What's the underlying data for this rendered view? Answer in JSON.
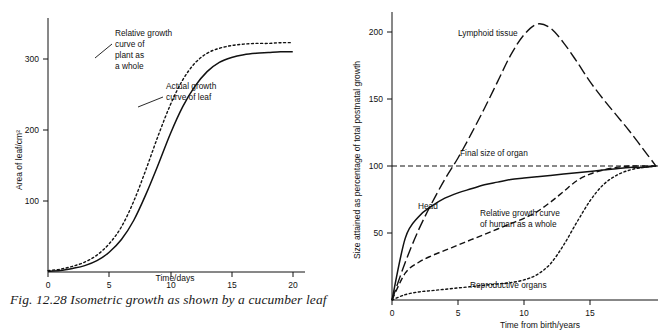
{
  "figure": {
    "caption": "Fig. 12.28 Isometric growth as shown by a cucumber leaf"
  },
  "chart_data": [
    {
      "type": "line",
      "title": "",
      "xlabel": "Time/days",
      "ylabel": "Area of leaf/cm²",
      "xlim": [
        0,
        21
      ],
      "ylim": [
        0,
        360
      ],
      "xticks": [
        "0",
        "5",
        "10",
        "15",
        "20"
      ],
      "yticks": [
        "100",
        "200",
        "300"
      ],
      "grid": false,
      "legend": "none",
      "annotations": [
        "Relative growth curve of plant as a whole",
        "Actual growth curve of leaf"
      ],
      "series": [
        {
          "name": "Relative growth curve of plant as a whole",
          "style": "dotted",
          "x": [
            0,
            1,
            2,
            3,
            4,
            5,
            6,
            7,
            8,
            9,
            10,
            11,
            12,
            13,
            14,
            15,
            16,
            17,
            18,
            19,
            20
          ],
          "y": [
            2,
            4,
            8,
            14,
            24,
            40,
            64,
            100,
            145,
            193,
            237,
            272,
            296,
            310,
            317,
            321,
            323,
            324,
            324,
            325,
            325
          ]
        },
        {
          "name": "Actual growth curve of leaf",
          "style": "solid",
          "x": [
            0,
            1,
            2,
            3,
            4,
            5,
            6,
            7,
            8,
            9,
            10,
            11,
            12,
            13,
            14,
            15,
            16,
            17,
            18,
            19,
            20
          ],
          "y": [
            1,
            2,
            5,
            9,
            16,
            28,
            46,
            73,
            110,
            152,
            196,
            234,
            263,
            284,
            297,
            304,
            308,
            310,
            311,
            312,
            312
          ]
        }
      ]
    },
    {
      "type": "line",
      "title": "",
      "xlabel": "Time from birth/years",
      "ylabel": "Size attained as percentage of total postnatal growth",
      "xlim": [
        0,
        20
      ],
      "ylim": [
        0,
        215
      ],
      "xticks": [
        "0",
        "5",
        "10",
        "15"
      ],
      "yticks": [
        "50",
        "100",
        "150",
        "200"
      ],
      "grid": false,
      "legend": "none",
      "annotations": [
        "Lymphoid tissue",
        "Final size of organ",
        "Head",
        "Relative growth curve of human as a whole",
        "Reproductive organs"
      ],
      "series": [
        {
          "name": "Lymphoid tissue",
          "style": "dash-dot-long",
          "x": [
            0,
            1,
            2,
            3,
            4,
            5,
            6,
            7,
            8,
            9,
            10,
            11,
            12,
            13,
            14,
            15,
            16,
            17,
            18,
            19,
            20
          ],
          "y": [
            0,
            28,
            52,
            72,
            90,
            106,
            124,
            143,
            163,
            183,
            198,
            206,
            203,
            192,
            178,
            163,
            150,
            138,
            126,
            113,
            100
          ]
        },
        {
          "name": "Head",
          "style": "solid",
          "x": [
            0,
            1,
            2,
            3,
            4,
            5,
            6,
            7,
            8,
            9,
            10,
            11,
            12,
            13,
            14,
            15,
            16,
            17,
            18,
            19,
            20
          ],
          "y": [
            0,
            46,
            62,
            70,
            76,
            80,
            83,
            86,
            88,
            90,
            91,
            92,
            93,
            94,
            95,
            96,
            97,
            98,
            99,
            99,
            100
          ]
        },
        {
          "name": "Relative growth curve of human as a whole",
          "style": "dashed",
          "x": [
            0,
            1,
            2,
            3,
            4,
            5,
            6,
            7,
            8,
            9,
            10,
            11,
            12,
            13,
            14,
            15,
            16,
            17,
            18,
            19,
            20
          ],
          "y": [
            0,
            20,
            28,
            33,
            37,
            41,
            45,
            49,
            53,
            57,
            61,
            66,
            73,
            81,
            89,
            94,
            97,
            99,
            100,
            100,
            100
          ]
        },
        {
          "name": "Reproductive organs",
          "style": "dotted",
          "x": [
            0,
            1,
            2,
            3,
            4,
            5,
            6,
            7,
            8,
            9,
            10,
            11,
            12,
            13,
            14,
            15,
            16,
            17,
            18,
            19,
            20
          ],
          "y": [
            0,
            4,
            6,
            7,
            8,
            9,
            10,
            11,
            12,
            13,
            15,
            19,
            27,
            41,
            58,
            74,
            86,
            93,
            97,
            99,
            100
          ]
        },
        {
          "name": "Final size of organ",
          "style": "dashed-reference",
          "x": [
            0,
            20
          ],
          "y": [
            100,
            100
          ]
        }
      ]
    }
  ]
}
